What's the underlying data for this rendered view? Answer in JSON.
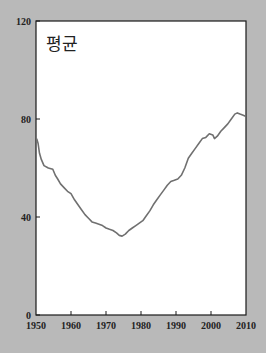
{
  "chart_data": {
    "type": "line",
    "title": "평균",
    "xlabel": "",
    "ylabel": "",
    "xlim": [
      1950,
      2010
    ],
    "ylim": [
      0,
      120
    ],
    "x_ticks": [
      1950,
      1960,
      1970,
      1980,
      1990,
      2000,
      2010
    ],
    "y_ticks": [
      0,
      40,
      80,
      120
    ],
    "grid": false,
    "legend": null,
    "series": [
      {
        "name": "평균",
        "color": "#707070",
        "x": [
          1950.2,
          1950.6,
          1951.0,
          1951.5,
          1952.3,
          1953.5,
          1954.8,
          1955.5,
          1956.2,
          1957.0,
          1958.0,
          1959.0,
          1960.0,
          1961.0,
          1962.0,
          1963.0,
          1964.0,
          1965.0,
          1966.0,
          1967.0,
          1968.0,
          1969.0,
          1970.0,
          1971.0,
          1972.0,
          1973.0,
          1973.8,
          1974.6,
          1975.5,
          1976.5,
          1977.5,
          1978.5,
          1979.5,
          1980.5,
          1981.5,
          1982.5,
          1983.5,
          1984.5,
          1985.5,
          1986.5,
          1987.5,
          1988.5,
          1989.5,
          1990.5,
          1991.5,
          1992.5,
          1993.5,
          1994.5,
          1995.5,
          1996.5,
          1997.5,
          1998.5,
          1999.5,
          2000.5,
          2001.0,
          2001.8,
          2002.8,
          2003.8,
          2004.8,
          2005.8,
          2006.8,
          2007.5,
          2008.3,
          2009.2,
          2010.0
        ],
        "values": [
          72.0,
          70.0,
          66.0,
          63.5,
          61.0,
          60.0,
          59.5,
          57.0,
          55.5,
          53.5,
          52.0,
          50.5,
          49.5,
          47.0,
          45.0,
          43.0,
          41.0,
          39.5,
          38.0,
          37.5,
          37.0,
          36.5,
          35.5,
          35.0,
          34.5,
          33.5,
          32.5,
          32.2,
          33.0,
          34.5,
          35.5,
          36.5,
          37.5,
          38.5,
          40.5,
          42.5,
          45.0,
          47.0,
          49.0,
          51.0,
          53.0,
          54.5,
          55.0,
          55.5,
          57.0,
          60.0,
          64.0,
          66.0,
          68.0,
          70.0,
          72.0,
          72.5,
          74.0,
          73.5,
          72.0,
          73.0,
          75.0,
          76.5,
          78.0,
          80.0,
          82.0,
          82.5,
          82.0,
          81.5,
          81.0
        ]
      }
    ]
  }
}
